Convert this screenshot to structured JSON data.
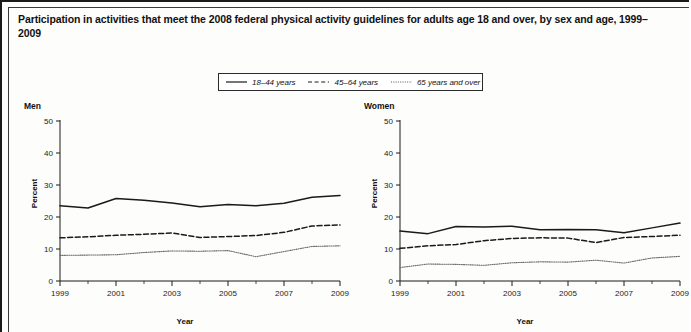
{
  "figure": {
    "title": "Participation in activities that meet the 2008 federal physical activity guidelines for adults age 18 and over, by sex and age, 1999–2009"
  },
  "legend": {
    "items": [
      {
        "label": "18–44 years",
        "style": "solid",
        "key_icon": "solid-line-icon"
      },
      {
        "label": "45–64 years",
        "style": "dashed",
        "key_icon": "dashed-line-icon"
      },
      {
        "label": "65 years and over",
        "style": "dotted",
        "key_icon": "dotted-line-icon"
      }
    ]
  },
  "panels": {
    "men": {
      "title": "Men",
      "xlabel": "Year",
      "ylabel": "Percent"
    },
    "women": {
      "title": "Women",
      "xlabel": "Year",
      "ylabel": "Percent"
    }
  },
  "chart_data": [
    {
      "type": "line",
      "title": "Men",
      "subtitle": "",
      "xlabel": "Year",
      "ylabel": "Percent",
      "x": [
        1999,
        2000,
        2001,
        2002,
        2003,
        2004,
        2005,
        2006,
        2007,
        2008,
        2009
      ],
      "xlim": [
        1999,
        2009
      ],
      "ylim": [
        0,
        50
      ],
      "yticks": [
        0,
        10,
        20,
        30,
        40,
        50
      ],
      "xticks_major": [
        1999,
        2001,
        2003,
        2005,
        2007,
        2009
      ],
      "xticks_minor": [
        2000,
        2002,
        2004,
        2006,
        2008
      ],
      "grid": false,
      "legend_position": "top-center-shared",
      "series": [
        {
          "name": "18–44 years",
          "style": "solid",
          "values": [
            23.5,
            22.8,
            25.8,
            25.2,
            24.4,
            23.2,
            23.9,
            23.5,
            24.3,
            26.2,
            26.7
          ]
        },
        {
          "name": "45–64 years",
          "style": "dashed",
          "values": [
            13.5,
            13.8,
            14.3,
            14.6,
            15.0,
            13.6,
            13.9,
            14.2,
            15.2,
            17.2,
            17.5
          ]
        },
        {
          "name": "65 years and over",
          "style": "dotted",
          "values": [
            8.0,
            8.1,
            8.2,
            8.9,
            9.4,
            9.3,
            9.5,
            7.6,
            9.2,
            10.8,
            11.0
          ]
        }
      ]
    },
    {
      "type": "line",
      "title": "Women",
      "subtitle": "",
      "xlabel": "Year",
      "ylabel": "Percent",
      "x": [
        1999,
        2000,
        2001,
        2002,
        2003,
        2004,
        2005,
        2006,
        2007,
        2008,
        2009
      ],
      "xlim": [
        1999,
        2009
      ],
      "ylim": [
        0,
        50
      ],
      "yticks": [
        0,
        10,
        20,
        30,
        40,
        50
      ],
      "xticks_major": [
        1999,
        2001,
        2003,
        2005,
        2007,
        2009
      ],
      "xticks_minor": [
        2000,
        2002,
        2004,
        2006,
        2008
      ],
      "grid": false,
      "legend_position": "top-center-shared",
      "series": [
        {
          "name": "18–44 years",
          "style": "solid",
          "values": [
            15.6,
            14.8,
            17.0,
            16.9,
            17.1,
            16.0,
            16.1,
            16.0,
            15.1,
            16.6,
            18.1
          ]
        },
        {
          "name": "45–64 years",
          "style": "dashed",
          "values": [
            10.2,
            11.0,
            11.4,
            12.6,
            13.3,
            13.5,
            13.4,
            12.0,
            13.6,
            13.9,
            14.3
          ]
        },
        {
          "name": "65 years and over",
          "style": "dotted",
          "values": [
            4.2,
            5.3,
            5.2,
            4.9,
            5.7,
            6.0,
            5.9,
            6.5,
            5.6,
            7.2,
            7.7
          ]
        }
      ]
    }
  ]
}
